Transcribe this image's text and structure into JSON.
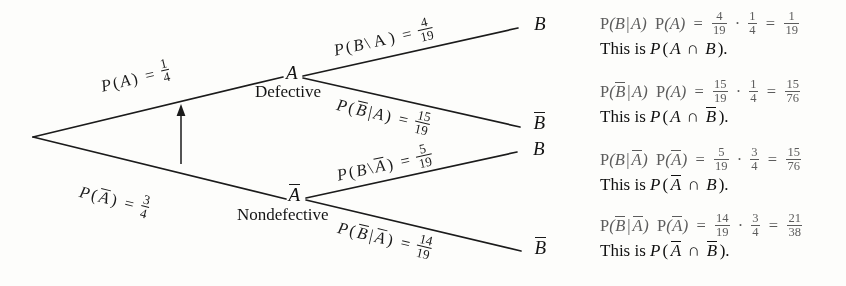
{
  "figure": {
    "type": "probability-tree-diagram"
  },
  "tree": {
    "root": {
      "label": ""
    },
    "stage1": [
      {
        "id": "A",
        "letter": "A",
        "word": "Defective",
        "branch_label": {
          "prefix": "P(A)",
          "equals": "=",
          "numerator": "1",
          "denominator": "4"
        }
      },
      {
        "id": "Abar",
        "letter": "A",
        "letter_bar": true,
        "word": "Nondefective",
        "branch_label": {
          "prefix": "P(A)",
          "prefix_bar": true,
          "equals": "=",
          "numerator": "3",
          "denominator": "4"
        }
      }
    ],
    "stage2": [
      {
        "id": "A-B",
        "terminal": "B",
        "terminal_bar": false,
        "branch_label": {
          "prefix": "P(B|A)",
          "equals": "=",
          "numerator": "4",
          "denominator": "19"
        }
      },
      {
        "id": "A-Bbar",
        "terminal": "B",
        "terminal_bar": true,
        "branch_label": {
          "prefix": "P(B|A)",
          "equals": "=",
          "numerator": "15",
          "denominator": "19"
        }
      },
      {
        "id": "Abar-B",
        "terminal": "B",
        "terminal_bar": false,
        "branch_label": {
          "prefix": "P(B|A)",
          "equals": "=",
          "numerator": "5",
          "denominator": "19"
        }
      },
      {
        "id": "Abar-Bbar",
        "terminal": "B",
        "terminal_bar": true,
        "branch_label": {
          "prefix": "P(B|A)",
          "equals": "=",
          "numerator": "14",
          "denominator": "19"
        }
      }
    ],
    "arrow": {
      "name": "upward-arrow",
      "points_to": "P(A) branch"
    }
  },
  "results": [
    {
      "id": "result-1",
      "factor1": {
        "num": "4",
        "den": "19"
      },
      "factor2": {
        "num": "1",
        "den": "4"
      },
      "product": {
        "num": "1",
        "den": "19"
      },
      "caption_prefix": "This is",
      "caption_event": "P(A ∩ B).",
      "intersection": "∩"
    },
    {
      "id": "result-2",
      "factor1": {
        "num": "15",
        "den": "19"
      },
      "factor2": {
        "num": "1",
        "den": "4"
      },
      "product": {
        "num": "15",
        "den": "76"
      },
      "caption_prefix": "This is",
      "caption_event": "P(A ∩ B̄).",
      "intersection": "∩"
    },
    {
      "id": "result-3",
      "factor1": {
        "num": "5",
        "den": "19"
      },
      "factor2": {
        "num": "3",
        "den": "4"
      },
      "product": {
        "num": "15",
        "den": "76"
      },
      "caption_prefix": "This is",
      "caption_event": "P(Ā ∩ B).",
      "intersection": "∩"
    },
    {
      "id": "result-4",
      "factor1": {
        "num": "14",
        "den": "19"
      },
      "factor2": {
        "num": "3",
        "den": "4"
      },
      "product": {
        "num": "21",
        "den": "38"
      },
      "caption_prefix": "This is",
      "caption_event": "P(Ā ∩ B̄).",
      "intersection": "∩"
    }
  ],
  "symbols": {
    "P": "P",
    "open_paren": "(",
    "close_paren": ")",
    "vertical_bar": "|",
    "backslash": "\\",
    "equals": "=",
    "times_dot": "·",
    "intersection": "∩",
    "A": "A",
    "B": "B"
  },
  "colors": {
    "background": "#fdfdfb",
    "ink": "#141414",
    "equation_gray": "#5c5c5c",
    "line": "#1b1b1b"
  }
}
